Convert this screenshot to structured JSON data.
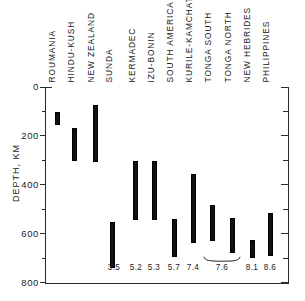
{
  "chart_data": {
    "type": "bar",
    "orientation": "vertical-range",
    "title": "",
    "xlabel": "",
    "ylabel": "DEPTH, KM",
    "ylim": [
      0,
      800
    ],
    "y_inverted": true,
    "y_ticks_major": [
      0,
      200,
      400,
      600,
      800
    ],
    "y_ticks_minor": [
      100,
      300,
      500,
      700
    ],
    "y_tick_labels": [
      "0",
      "200",
      "400",
      "600",
      "800"
    ],
    "grid": false,
    "legend": null,
    "categories": [
      "ROUMANIA",
      "HINDU-KUSH",
      "NEW ZEALAND",
      "SUNDA",
      "KERMADEC",
      "IZU-BONIN",
      "SOUTH AMERICA",
      "KURILE-KAMCHATKA",
      "TONGA SOUTH",
      "TONGA NORTH",
      "NEW HEBRIDES",
      "PHILIPPINES"
    ],
    "series": [
      {
        "name": "depth range",
        "ranges": [
          [
            102,
            151
          ],
          [
            167,
            298
          ],
          [
            73,
            302
          ],
          [
            551,
            735
          ],
          [
            302,
            539
          ],
          [
            302,
            539
          ],
          [
            539,
            690
          ],
          [
            355,
            633
          ],
          [
            482,
            624
          ],
          [
            535,
            674
          ],
          [
            624,
            694
          ],
          [
            514,
            686
          ]
        ]
      }
    ],
    "annotations": [
      {
        "text": "3.5",
        "category": "SUNDA",
        "note": "magnitude label below axis"
      },
      {
        "text": "5.2",
        "category": "KERMADEC",
        "note": "magnitude label below axis"
      },
      {
        "text": "5.3",
        "category": "IZU-BONIN",
        "note": "magnitude label below axis"
      },
      {
        "text": "5.7",
        "category": "SOUTH AMERICA",
        "note": "magnitude label below axis"
      },
      {
        "text": "7.4",
        "category": "KURILE-KAMCHATKA",
        "note": "magnitude label below axis"
      },
      {
        "text": "7.6",
        "category": "TONGA",
        "note": "magnitude label below axis, braced across Tonga South and Tonga North"
      },
      {
        "text": "8.1",
        "category": "NEW HEBRIDES",
        "note": "magnitude label below axis"
      },
      {
        "text": "8.6",
        "category": "PHILIPPINES",
        "note": "magnitude label below axis"
      }
    ]
  },
  "axes": {
    "y_title": "DEPTH, KM",
    "y_labels": [
      "0",
      "200",
      "400",
      "600",
      "800"
    ]
  },
  "magnitudes": [
    {
      "label": "3.5",
      "x": 114
    },
    {
      "label": "5.2",
      "x": 136
    },
    {
      "label": "5.3",
      "x": 154
    },
    {
      "label": "5.7",
      "x": 174
    },
    {
      "label": "7.4",
      "x": 193
    },
    {
      "label": "7.6",
      "x": 222
    },
    {
      "label": "8.1",
      "x": 252
    },
    {
      "label": "8.6",
      "x": 270
    }
  ],
  "bars": [
    {
      "name": "ROUMANIA",
      "x": 55,
      "top": 112,
      "bottom": 124.5
    },
    {
      "name": "HINDU-KUSH",
      "x": 72,
      "top": 128,
      "bottom": 160.5
    },
    {
      "name": "NEW ZEALAND",
      "x": 93,
      "top": 105,
      "bottom": 161.5
    },
    {
      "name": "SUNDA",
      "x": 110,
      "top": 222,
      "bottom": 267.5
    },
    {
      "name": "KERMADEC",
      "x": 133,
      "top": 161,
      "bottom": 219.5
    },
    {
      "name": "IZU-BONIN",
      "x": 152,
      "top": 161,
      "bottom": 219.5
    },
    {
      "name": "SOUTH AMERICA",
      "x": 172,
      "top": 219,
      "bottom": 256.5
    },
    {
      "name": "KURILE-KAMCHATKA",
      "x": 191,
      "top": 174,
      "bottom": 242.5
    },
    {
      "name": "TONGA SOUTH",
      "x": 210,
      "top": 205,
      "bottom": 240.5
    },
    {
      "name": "TONGA NORTH",
      "x": 230,
      "top": 218,
      "bottom": 252.5
    },
    {
      "name": "NEW HEBRIDES",
      "x": 250,
      "top": 240,
      "bottom": 257.5
    },
    {
      "name": "PHILIPPINES",
      "x": 268,
      "top": 213,
      "bottom": 255.5
    }
  ],
  "category_label_x": [
    56,
    75,
    95,
    113,
    136,
    155,
    174,
    193,
    212,
    232,
    251,
    270
  ]
}
